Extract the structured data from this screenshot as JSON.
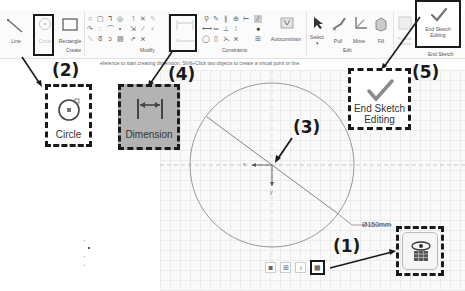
{
  "ribbon": {
    "groups": [
      {
        "label": "Create",
        "buttons": [
          {
            "label": "Line",
            "icon": "line-icon",
            "enabled": true
          },
          {
            "label": "Circle",
            "icon": "circle-icon",
            "enabled": false
          },
          {
            "label": "Rectangle",
            "icon": "rectangle-icon",
            "enabled": true
          }
        ]
      },
      {
        "label": "Modify"
      },
      {
        "label": "Constraints",
        "buttons": [
          {
            "label": "Dimension",
            "icon": "dimension-icon",
            "enabled": false
          },
          {
            "label": "Autoconstrain",
            "icon": "autoconstrain-icon",
            "enabled": true
          }
        ]
      },
      {
        "label": "Edit",
        "buttons": [
          {
            "label": "Select",
            "icon": "select-arrow-icon",
            "enabled": true
          },
          {
            "label": "Pull",
            "icon": "pull-icon",
            "enabled": true
          },
          {
            "label": "Move",
            "icon": "move-icon",
            "enabled": true
          },
          {
            "label": "Fill",
            "icon": "fill-icon",
            "enabled": true
          }
        ]
      },
      {
        "label": "End Sketch",
        "buttons": [
          {
            "label": "Finalize Sketch",
            "icon": "finalize-icon",
            "enabled": false
          },
          {
            "label": "End Sketch Editing",
            "line1": "End Sketch",
            "line2": "Editing",
            "icon": "checkmark-icon",
            "enabled": true
          }
        ]
      }
    ]
  },
  "hint": "eference to start creating dimension. Shift+Click two objects to create a virtual point or line.",
  "canvas": {
    "dimension_label": "Ø150mm",
    "axis_x_label": "x",
    "axis_y_label": "y"
  },
  "callouts": [
    {
      "number": "(1)",
      "target": "plan-view-button"
    },
    {
      "number": "(2)",
      "target": "circle-tool",
      "label": "Circle"
    },
    {
      "number": "(3)",
      "target": "origin"
    },
    {
      "number": "(4)",
      "target": "dimension-tool",
      "label": "Dimension"
    },
    {
      "number": "(5)",
      "target": "end-sketch-editing",
      "line1": "End Sketch",
      "line2": "Editing"
    }
  ],
  "colors": {
    "annotation": "#1a1a1a",
    "dimension_highlight": "#b3b3b3",
    "checkmark": "#8a8a8a",
    "sketch_line": "#8c8c8c"
  }
}
